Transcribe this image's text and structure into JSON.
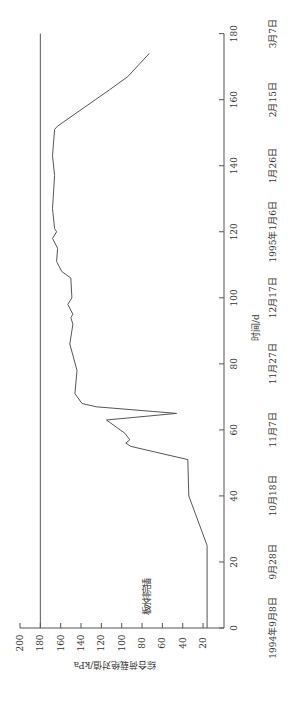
{
  "chart_data": {
    "type": "line",
    "orientation": "rotated-90 (time axis vertical on right, pressure axis horizontal at bottom)",
    "xlabel": "时间/d",
    "ylabel": "综合荷载绝对值/kPa",
    "xlim": [
      0,
      180
    ],
    "ylim": [
      0,
      200
    ],
    "x_ticks": [
      0,
      20,
      40,
      60,
      80,
      100,
      120,
      140,
      160,
      180
    ],
    "y_ticks": [
      20,
      40,
      60,
      80,
      100,
      120,
      140,
      160,
      180,
      200
    ],
    "date_labels": [
      "1994年9月8日",
      "9月28日",
      "10月18日",
      "11月7日",
      "11月27日",
      "12月17日",
      "1995年1月6日",
      "1月26日",
      "2月15日",
      "3月7日"
    ],
    "reference_line": {
      "y": 180,
      "label": ""
    },
    "annotations": [
      {
        "text": "插完排水板",
        "x": 17,
        "y": 55
      }
    ],
    "grid": false,
    "series": [
      {
        "name": "综合荷载绝对值",
        "x": [
          0,
          25,
          40,
          51,
          55,
          56,
          57,
          59,
          63,
          65,
          67,
          68,
          71,
          78,
          86,
          92,
          94,
          95,
          98,
          100,
          106,
          108,
          111,
          115,
          118,
          120,
          121,
          127,
          137,
          143,
          151,
          152,
          163,
          167,
          174
        ],
        "y": [
          16,
          16,
          34,
          35,
          91,
          96,
          92,
          97,
          115,
          46,
          125,
          139,
          146,
          144,
          151,
          148,
          150,
          148,
          153,
          149,
          150,
          159,
          164,
          163,
          168,
          164,
          166,
          168,
          166,
          168,
          166,
          163,
          112,
          94,
          73
        ]
      }
    ]
  }
}
